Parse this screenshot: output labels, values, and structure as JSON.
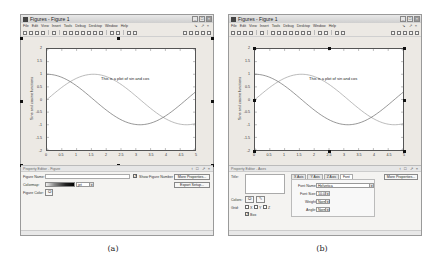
{
  "captions": {
    "a": "(a)",
    "b": "(b)"
  },
  "window_title": "Figures - Figure 1",
  "title_buttons": [
    "_",
    "□",
    "×"
  ],
  "menu": [
    "File",
    "Edit",
    "View",
    "Insert",
    "Tools",
    "Debug",
    "Desktop",
    "Window",
    "Help"
  ],
  "menu_right": "↘ ↗ ×",
  "pe_header_buttons": "↕ □ ↗ ×",
  "chart_data": {
    "type": "line",
    "title": "",
    "xlabel": "",
    "ylabel": "Sine and cosine functions",
    "xlim": [
      0,
      5
    ],
    "ylim": [
      -2,
      2
    ],
    "x_ticks": [
      "0",
      "0.5",
      "1",
      "1.5",
      "2",
      "2.5",
      "3",
      "3.5",
      "4",
      "4.5",
      "5"
    ],
    "y_ticks": [
      "2",
      "1.5",
      "1",
      "0.5",
      "0",
      "-0.5",
      "-1",
      "-1.5",
      "-2"
    ],
    "annotation": "This is a plot of sin and cos",
    "series": [
      {
        "name": "sin(x)",
        "x": [
          0,
          0.5,
          1,
          1.5,
          2,
          2.5,
          3,
          3.5,
          4,
          4.5,
          5
        ],
        "values": [
          0,
          0.48,
          0.84,
          1.0,
          0.91,
          0.6,
          0.14,
          -0.35,
          -0.76,
          -0.98,
          -0.96
        ]
      },
      {
        "name": "cos(x)",
        "x": [
          0,
          0.5,
          1,
          1.5,
          2,
          2.5,
          3,
          3.5,
          4,
          4.5,
          5
        ],
        "values": [
          1.0,
          0.88,
          0.54,
          0.07,
          -0.42,
          -0.8,
          -0.99,
          -0.94,
          -0.65,
          -0.21,
          0.28
        ]
      }
    ]
  },
  "panel_a": {
    "header": "Property Editor - Figure",
    "figure_name_label": "Figure Name:",
    "figure_name_value": "",
    "colormap_label": "Colormap:",
    "colormap_value": "jet",
    "figure_color_label": "Figure Color:",
    "show_figure_number_label": "Show Figure Number",
    "show_figure_number_checked": true,
    "more_properties_button": "More Properties...",
    "export_setup_button": "Export Setup..."
  },
  "panel_b": {
    "header": "Property Editor - Axes",
    "title_label": "Title:",
    "colors_label": "Colors:",
    "grid_label": "Grid:",
    "grid_options": [
      "X",
      "Y",
      "Z"
    ],
    "box_label": "Box",
    "box_checked": true,
    "tabs": [
      "X Axis",
      "Y Axis",
      "Z Axis",
      "Font"
    ],
    "active_tab": "Font",
    "font_name_label": "Font Name:",
    "font_name_value": "Helvetica",
    "font_size_label": "Font Size:",
    "font_size_value": "10.0",
    "weight_label": "Weight:",
    "weight_value": "Normal",
    "angle_label": "Angle:",
    "angle_value": "Normal",
    "more_properties_button": "More Properties..."
  }
}
